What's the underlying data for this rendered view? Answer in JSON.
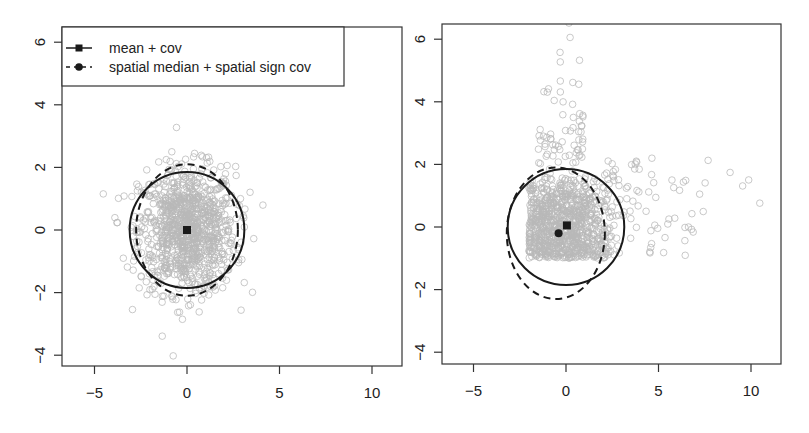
{
  "chart_data": [
    {
      "type": "scatter",
      "panel": "left",
      "title": "",
      "xlabel": "",
      "ylabel": "",
      "xlim": [
        -6.5,
        11.8
      ],
      "ylim": [
        -4.5,
        6.5
      ],
      "xticks": [
        -5,
        0,
        5,
        10
      ],
      "yticks": [
        -4,
        -2,
        0,
        2,
        4,
        6
      ],
      "xtick_labels": [
        "−5",
        "0",
        "5",
        "10"
      ],
      "ytick_labels": [
        "−4",
        "−2",
        "0",
        "2",
        "4",
        "6"
      ],
      "grid": false,
      "legend": {
        "placement": "top-left",
        "entries": [
          {
            "label": "mean + cov",
            "line": "solid",
            "marker": "square"
          },
          {
            "label": "spatial median + spatial sign cov",
            "line": "dashed",
            "marker": "circle"
          }
        ]
      },
      "points": {
        "distribution": "bivariate normal",
        "center": [
          0,
          0
        ],
        "sd": [
          1.3,
          1.0
        ],
        "count": 1000,
        "color": "#b8b8b8"
      },
      "estimates": [
        {
          "name": "mean + cov",
          "location": [
            0,
            0
          ],
          "ellipse_semi_axes": [
            3.1,
            1.85
          ],
          "style": "solid",
          "marker": "square"
        },
        {
          "name": "spatial median + spatial sign cov",
          "location": [
            0,
            0
          ],
          "ellipse_semi_axes": [
            2.75,
            2.1
          ],
          "style": "dashed",
          "marker": "circle"
        }
      ]
    },
    {
      "type": "scatter",
      "panel": "right",
      "title": "",
      "xlabel": "",
      "ylabel": "",
      "xlim": [
        -6.5,
        11.8
      ],
      "ylim": [
        -4.5,
        6.5
      ],
      "xticks": [
        -5,
        0,
        5,
        10
      ],
      "yticks": [
        -4,
        -2,
        0,
        2,
        4,
        6
      ],
      "xtick_labels": [
        "−5",
        "0",
        "5",
        "10"
      ],
      "ytick_labels": [
        "−4",
        "−2",
        "0",
        "2",
        "4",
        "6"
      ],
      "grid": false,
      "points": {
        "distribution": "uniform block with skewed outliers",
        "block_x": [
          -2,
          3
        ],
        "block_y": [
          -1,
          2
        ],
        "count": 1000,
        "color": "#b8b8b8"
      },
      "estimates": [
        {
          "name": "mean + cov",
          "location": [
            0.05,
            0.05
          ],
          "ellipse_center": [
            0,
            0
          ],
          "ellipse_semi_axes": [
            3.15,
            1.85
          ],
          "style": "solid",
          "marker": "square"
        },
        {
          "name": "spatial median + spatial sign cov",
          "location": [
            -0.4,
            -0.2
          ],
          "ellipse_center": [
            -0.55,
            -0.2
          ],
          "ellipse_semi_axes": [
            2.65,
            2.1
          ],
          "style": "dashed",
          "marker": "circle"
        }
      ]
    }
  ]
}
